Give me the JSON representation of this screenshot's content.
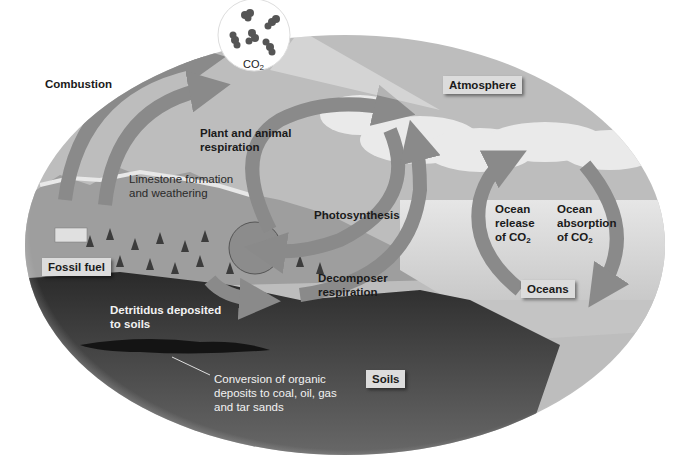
{
  "diagram": {
    "color_mode": "grayscale",
    "reservoirs": {
      "atmosphere": "Atmosphere",
      "oceans": "Oceans",
      "soils": "Soils",
      "fossil_fuel": "Fossil fuel"
    },
    "molecule_label": {
      "main": "CO",
      "sub": "2"
    },
    "processes": {
      "combustion": "Combustion",
      "plant_animal_respiration": "Plant and animal\nrespiration",
      "limestone": "Limestone formation\nand weathering",
      "photosynthesis": "Photosynthesis",
      "decomposer_respiration": "Decomposer\nrespiration",
      "ocean_release": {
        "line1": "Ocean\nrelease\nof CO",
        "sub": "2"
      },
      "ocean_absorption": {
        "line1": "Ocean\nabsorption\nof CO",
        "sub": "2"
      },
      "detritus": "Detritidus deposited\nto soils",
      "conversion": "Conversion of organic\ndeposits to coal, oil, gas\nand tar sands"
    },
    "colors": {
      "sky": "#b9b9b9",
      "cloud": "#ececec",
      "land": "#a9a9a9",
      "ocean": "#d8d8d8",
      "soil": "#3a3a3a",
      "arrow": "#8a8a8a"
    }
  }
}
